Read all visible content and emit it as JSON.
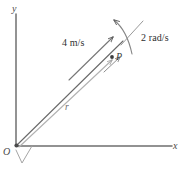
{
  "figure": {
    "background_color": "#ffffff",
    "stroke_color": "#555555",
    "axis_color": "#6b6b6b",
    "vector_color": "#9a9a9a",
    "text_color": "#3a3a3a",
    "axes": {
      "y_label": "y",
      "x_label": "x",
      "origin_label": "O"
    },
    "point": {
      "label": "P"
    },
    "vectors": {
      "radius_label": "r"
    },
    "annotations": {
      "linear_velocity": "4 m/s",
      "angular_velocity": "2 rad/s"
    }
  }
}
